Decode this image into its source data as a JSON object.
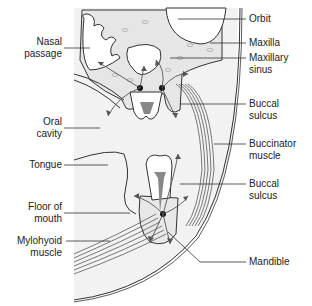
{
  "figure": {
    "caption": "Fig. 21.2  Pathways of spread of infection from the teeth"
  },
  "labels": {
    "left": [
      {
        "id": "nasal-passage",
        "text": "Nasal\npassage"
      },
      {
        "id": "oral-cavity",
        "text": "Oral\ncavity"
      },
      {
        "id": "tongue",
        "text": "Tongue"
      },
      {
        "id": "floor-of-mouth",
        "text": "Floor of\nmouth"
      },
      {
        "id": "mylohyoid-muscle",
        "text": "Mylohyoid\nmuscle"
      }
    ],
    "right": [
      {
        "id": "orbit",
        "text": "Orbit"
      },
      {
        "id": "maxilla",
        "text": "Maxilla"
      },
      {
        "id": "maxillary-sinus",
        "text": "Maxillary\nsinus"
      },
      {
        "id": "buccal-sulcus-upper",
        "text": "Buccal\nsulcus"
      },
      {
        "id": "buccinator-muscle",
        "text": "Buccinator\nmuscle"
      },
      {
        "id": "buccal-sulcus-lower",
        "text": "Buccal\nsulcus"
      },
      {
        "id": "mandible",
        "text": "Mandible"
      }
    ]
  },
  "colors": {
    "line": "#333333",
    "bone_fill": "#e8e8e8",
    "soft_tissue": "#f1f1f1",
    "arrow": "#666666",
    "pulp": "#8a8a8a"
  }
}
